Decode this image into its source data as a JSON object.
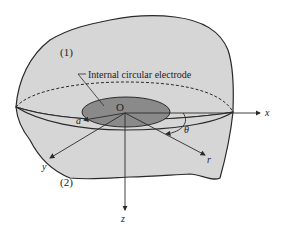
{
  "diagram": {
    "title": "",
    "region_labels": {
      "upper": "(1)",
      "lower": "(2)"
    },
    "callout": "Internal circular electrode",
    "origin_label": "O",
    "radius_label": "a",
    "angle_label": "θ",
    "axes": {
      "x": "x",
      "y": "y",
      "z": "z",
      "r": "r"
    },
    "colors": {
      "body_fill": "#d6d6d6",
      "electrode_fill": "#8a8a8a",
      "outline": "#2a2a2a",
      "background": "#ffffff"
    }
  }
}
